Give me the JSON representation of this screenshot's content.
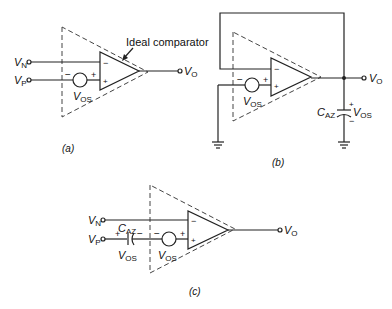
{
  "figure": {
    "panels": [
      {
        "id": "a",
        "caption": "(a)",
        "annotation": "Ideal comparator",
        "inputs": {
          "vn": "V",
          "vn_sub": "N",
          "vp": "V",
          "vp_sub": "P"
        },
        "output": {
          "v": "V",
          "sub": "O"
        },
        "offset_source": {
          "v": "V",
          "sub": "OS",
          "minus": "−",
          "plus": "+"
        },
        "opamp_signs": {
          "inv": "−",
          "noninv": "+"
        }
      },
      {
        "id": "b",
        "caption": "(b)",
        "output": {
          "v": "V",
          "sub": "O"
        },
        "offset_source": {
          "v": "V",
          "sub": "OS",
          "minus": "−",
          "plus": "+"
        },
        "capacitor": {
          "c": "C",
          "sub": "AZ",
          "v": "V",
          "vsub": "OS",
          "plus": "+",
          "minus": "−"
        },
        "opamp_signs": {
          "inv": "−",
          "noninv": "+"
        }
      },
      {
        "id": "c",
        "caption": "(c)",
        "inputs": {
          "vn": "V",
          "vn_sub": "N",
          "vp": "V",
          "vp_sub": "P"
        },
        "output": {
          "v": "V",
          "sub": "O"
        },
        "offset_source": {
          "v": "V",
          "sub": "OS",
          "minus": "−",
          "plus": "+"
        },
        "capacitor": {
          "c": "C",
          "sub": "AZ",
          "v": "V",
          "vsub": "OS",
          "plus": "+",
          "minus": "−"
        },
        "opamp_signs": {
          "inv": "−",
          "noninv": "+"
        }
      }
    ]
  }
}
